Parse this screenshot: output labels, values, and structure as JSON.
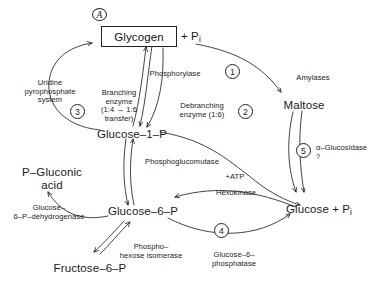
{
  "figure": {
    "panel_tag": "A",
    "nodes": {
      "glycogen": "Glycogen",
      "glycogen_pi_suffix": "+ P",
      "glycogen_pi_sub": "i",
      "glucose_1_p": "Glucose–1–P",
      "glucose_6_p": "Glucose–​6–P",
      "fructose_6_p": "Fructose–6–P",
      "maltose": "Maltose",
      "p_gluconic_acid": "P–Gluconic\nacid",
      "glucose_pi": "Glucose + P",
      "glucose_pi_sub": "i"
    },
    "enzymes": {
      "uridine_system": "Uridine\npyrophosphate\nsystem",
      "branching_enzyme": "Branching\nenzyme\n(1:4 → 1:6\ntransfer)",
      "phosphorylase": "Phosphorylase",
      "debranching_enzyme": "Debranching\nenzyme (1:6)",
      "amylases": "Amylases",
      "alpha_glucosidase": "α–Glucosidase\n?",
      "phosphoglucomutase": "Phosphoglucomutase",
      "atp": "+ATP",
      "hexokinase": "Hexokinase",
      "glucose_6_phosphatase": "Glucose–6–\nphosphatase",
      "phosphohexose_isomerase": "Phospho–\nhexose isomerase",
      "g6p_dehydrogenase": "Glucose–\n6–P–dehydrogenase"
    },
    "steps": {
      "one": "1",
      "two": "2",
      "three": "3",
      "four": "4",
      "five": "5"
    },
    "colors": {
      "stroke": "#222222",
      "text": "#1a1a1a",
      "background": "#ffffff"
    }
  }
}
